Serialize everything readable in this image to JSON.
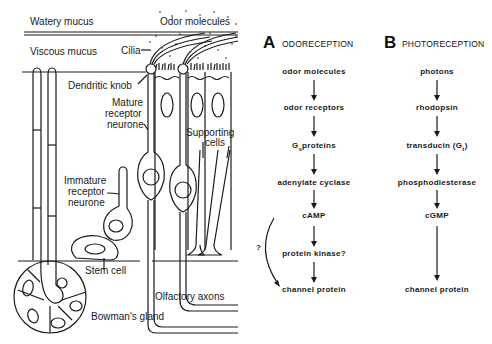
{
  "anatomy": {
    "labels": {
      "watery_mucus": "Watery mucus",
      "odor_molecules": "Odor molecules",
      "viscous_mucus": "Viscous mucus",
      "cilia": "Cilia",
      "dendritic_knob": "Dendritic knob",
      "mature_receptor_1": "Mature",
      "mature_receptor_2": "receptor",
      "mature_receptor_3": "neurone",
      "supporting_cells_1": "Supporting",
      "supporting_cells_2": "cells",
      "immature_receptor_1": "Immature",
      "immature_receptor_2": "receptor",
      "immature_receptor_3": "neurone",
      "stem_cell": "Stem cell",
      "olfactory_axons": "Olfactory axons",
      "bowmans_gland": "Bowman's gland"
    }
  },
  "panel_a": {
    "letter": "A",
    "title": "ODORECEPTION",
    "steps": [
      {
        "text": "odor molecules"
      },
      {
        "text": "odor receptors"
      },
      {
        "text": "G",
        "sub": "s",
        "rest": "proteins"
      },
      {
        "text": "adenylate cyclase"
      },
      {
        "text": "cAMP"
      },
      {
        "text": "protein kinase?"
      },
      {
        "text": "channel protein"
      }
    ],
    "bypass_label": "?"
  },
  "panel_b": {
    "letter": "B",
    "title": "PHOTORECEPTION",
    "steps": [
      {
        "text": "photons"
      },
      {
        "text": "rhodopsin"
      },
      {
        "text": "transducin (G",
        "sub": "t",
        "rest": ")"
      },
      {
        "text": "phosphodiesterase"
      },
      {
        "text": "cGMP"
      },
      {
        "text": "channel protein"
      }
    ]
  }
}
